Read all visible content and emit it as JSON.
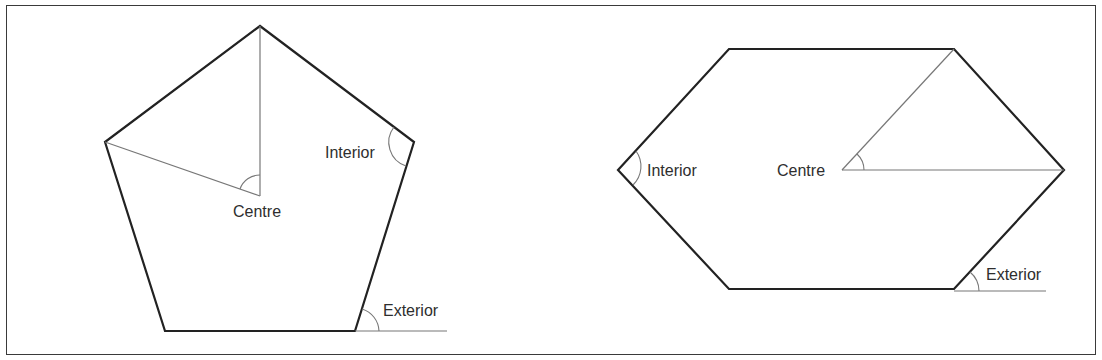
{
  "diagram": {
    "colors": {
      "outline": "#222222",
      "construction": "#777777",
      "text": "#2e2e2e",
      "frame": "#3a3a3a"
    },
    "pentagon": {
      "vertices": [
        [
          260,
          26
        ],
        [
          414,
          142
        ],
        [
          355,
          331
        ],
        [
          165,
          331
        ],
        [
          105,
          142
        ]
      ],
      "centre": [
        260,
        196
      ],
      "labels": {
        "centre": "Centre",
        "interior": "Interior",
        "exterior": "Exterior"
      }
    },
    "hexagon": {
      "vertices": [
        [
          729,
          49
        ],
        [
          954,
          49
        ],
        [
          1064,
          170
        ],
        [
          954,
          289
        ],
        [
          729,
          289
        ],
        [
          618,
          170
        ]
      ],
      "centre": [
        842,
        170
      ],
      "labels": {
        "centre": "Centre",
        "interior": "Interior",
        "exterior": "Exterior"
      }
    }
  }
}
